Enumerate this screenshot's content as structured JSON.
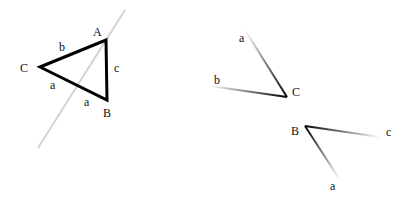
{
  "left_figure": {
    "title": "triangle-with-line",
    "vertices": [
      {
        "name": "A",
        "x": 106,
        "y": 40,
        "label_x": 93,
        "label_y": 36
      },
      {
        "name": "B",
        "x": 107,
        "y": 100,
        "label_x": 103,
        "label_y": 117
      },
      {
        "name": "C",
        "x": 40,
        "y": 67,
        "label_x": 20,
        "label_y": 72
      }
    ],
    "side_labels": [
      {
        "text": "b",
        "x": 59,
        "y": 51
      },
      {
        "text": "c",
        "x": 114,
        "y": 72
      },
      {
        "text": "a",
        "x": 50,
        "y": 89
      },
      {
        "text": "a",
        "x": 84,
        "y": 106
      }
    ],
    "triangle_color": "#000000",
    "cut_line": {
      "x1": 125,
      "y1": 10,
      "x2": 38,
      "y2": 148,
      "color": "#d4d4d4"
    }
  },
  "right_figure_top": {
    "vertex": {
      "name": "C",
      "x": 287,
      "y": 97,
      "label_x": 292,
      "label_y": 96
    },
    "rays": [
      {
        "label": "a",
        "x": 245,
        "y": 30,
        "label_x": 239,
        "label_y": 42
      },
      {
        "label": "b",
        "x": 210,
        "y": 86,
        "label_x": 214,
        "label_y": 84
      }
    ]
  },
  "right_figure_bottom": {
    "vertex": {
      "name": "B",
      "x": 305,
      "y": 126,
      "label_x": 291,
      "label_y": 135
    },
    "rays": [
      {
        "label": "c",
        "x": 380,
        "y": 137,
        "label_x": 386,
        "label_y": 136
      },
      {
        "label": "a",
        "x": 340,
        "y": 180,
        "label_x": 330,
        "label_y": 190
      }
    ]
  }
}
